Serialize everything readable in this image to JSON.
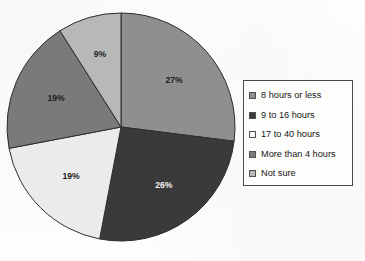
{
  "chart_data": {
    "type": "pie",
    "title": "",
    "subtitle": "",
    "xlabel": "",
    "ylabel": "",
    "legend_position": "right",
    "grid": false,
    "start_angle_deg": 0,
    "direction": "clockwise",
    "categories": [
      "8 hours or less",
      "9 to 16 hours",
      "17 to 40 hours",
      "More than 4 hours",
      "Not sure"
    ],
    "values": [
      27,
      26,
      19,
      19,
      9
    ],
    "value_unit": "%",
    "labels": [
      "27%",
      "26%",
      "19%",
      "19%",
      "9%"
    ],
    "colors": [
      "#8f8f8f",
      "#3a3a3a",
      "#ebebeb",
      "#7a7a7a",
      "#b8b8b8"
    ],
    "label_text_colors": [
      "#1c1c1c",
      "#f2f2f2",
      "#1c1c1c",
      "#1c1c1c",
      "#1c1c1c"
    ],
    "slices": [
      {
        "label": "8 hours or less",
        "value": 27,
        "display": "27%",
        "color": "#8f8f8f",
        "start_deg": 0.0,
        "end_deg": 97.2,
        "label_radius_frac": 0.62,
        "text_color": "#1c1c1c"
      },
      {
        "label": "9 to 16 hours",
        "value": 26,
        "display": "26%",
        "color": "#3a3a3a",
        "start_deg": 97.2,
        "end_deg": 190.8,
        "label_radius_frac": 0.64,
        "text_color": "#f2f2f2"
      },
      {
        "label": "17 to 40 hours",
        "value": 19,
        "display": "19%",
        "color": "#ebebeb",
        "start_deg": 190.8,
        "end_deg": 259.2,
        "label_radius_frac": 0.62,
        "text_color": "#1c1c1c"
      },
      {
        "label": "More than 4 hours",
        "value": 19,
        "display": "19%",
        "color": "#7a7a7a",
        "start_deg": 259.2,
        "end_deg": 327.6,
        "label_radius_frac": 0.62,
        "text_color": "#1c1c1c"
      },
      {
        "label": "Not sure",
        "value": 9,
        "display": "9%",
        "color": "#b8b8b8",
        "start_deg": 327.6,
        "end_deg": 360.0,
        "label_radius_frac": 0.66,
        "text_color": "#1c1c1c"
      }
    ],
    "geometry": {
      "center_x": 121,
      "center_y": 127,
      "radius": 114,
      "stroke": "#2d2d2d",
      "stroke_width": 1
    }
  },
  "legend": {
    "items": [
      {
        "label": "8 hours or less",
        "color": "#8f8f8f"
      },
      {
        "label": "9 to 16 hours",
        "color": "#3a3a3a"
      },
      {
        "label": "17 to 40 hours",
        "color": "#fbfbfb"
      },
      {
        "label": "More than 4 hours",
        "color": "#7a7a7a"
      },
      {
        "label": "Not sure",
        "color": "#b8b8b8"
      }
    ]
  }
}
